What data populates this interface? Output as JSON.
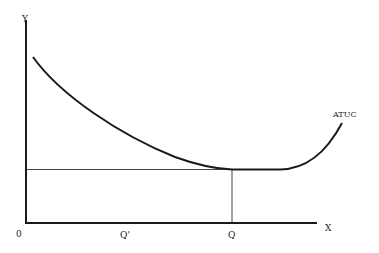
{
  "diagram": {
    "axes": {
      "y_label": "Y",
      "x_label": "X",
      "origin_label": "0"
    },
    "curve": {
      "label": "ATUC",
      "shape": "U-shaped: falls steeply, flattens to minimum at Q, then rises"
    },
    "markers": [
      {
        "label": "Q'",
        "description": "quantity below minimum-cost point"
      },
      {
        "label": "Q",
        "description": "quantity at minimum of ATUC"
      }
    ],
    "guides": {
      "horizontal": "line from Y axis at minimum ATUC level to Q",
      "vertical": "line from X axis at Q up to the curve minimum"
    },
    "colors": {
      "line": "#1a1a1a",
      "guide": "#333333",
      "background": "#ffffff"
    }
  }
}
